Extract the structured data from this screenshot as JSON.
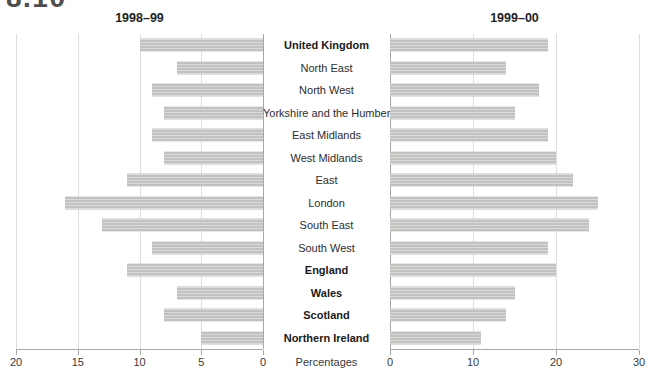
{
  "figure_number": "8.10",
  "xlabel": "Percentages",
  "chart_data": {
    "type": "bar",
    "orientation": "horizontal-back-to-back",
    "categories": [
      "United Kingdom",
      "North East",
      "North West",
      "Yorkshire and the Humber",
      "East Midlands",
      "West Midlands",
      "East",
      "London",
      "South East",
      "South West",
      "England",
      "Wales",
      "Scotland",
      "Northern Ireland"
    ],
    "bold_categories": [
      "United Kingdom",
      "England",
      "Wales",
      "Scotland",
      "Northern Ireland"
    ],
    "series": [
      {
        "name": "1998–99",
        "direction": "left",
        "axis_ticks": [
          20,
          15,
          10,
          5,
          0
        ],
        "axis_max": 20,
        "values": [
          10,
          7,
          9,
          8,
          9,
          8,
          11,
          16,
          13,
          9,
          11,
          7,
          8,
          5
        ]
      },
      {
        "name": "1999–00",
        "direction": "right",
        "axis_ticks": [
          0,
          10,
          20,
          30
        ],
        "axis_max": 30,
        "values": [
          19,
          14,
          18,
          15,
          19,
          20,
          22,
          25,
          24,
          19,
          20,
          15,
          14,
          11
        ]
      }
    ],
    "grid": true,
    "legend_position": "panel-titles-top",
    "colors": {
      "bar": "#c5c8c5",
      "gridline": "#dcdfdc",
      "axis": "#a5a9a6",
      "label_text": "#2d2d2d",
      "title_text": "#1e1e1e",
      "figure_number_text": "#4e4e4e"
    }
  }
}
